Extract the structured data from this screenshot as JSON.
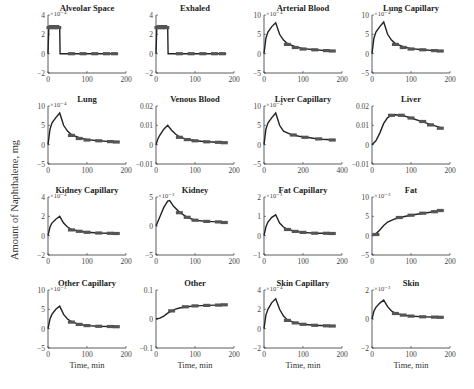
{
  "figure": {
    "ylabel": "Amount of Naphthalene, mg",
    "xlabel": "Time, min",
    "line_color": "#222222",
    "marker_color": "#555555"
  },
  "chart_data": [
    {
      "type": "line",
      "title": "Alveolar Space",
      "exponent": "×10⁻⁴",
      "ylim": [
        -2,
        4
      ],
      "yticks": [
        "4",
        "2",
        "0",
        "−2"
      ],
      "xlim": [
        0,
        200
      ],
      "xticks": [
        "0",
        "100",
        "200"
      ],
      "xlabel": "",
      "series": [
        {
          "name": "simulation",
          "x": [
            0,
            2,
            5,
            10,
            20,
            30,
            31,
            32,
            60,
            100,
            150,
            180
          ],
          "y": [
            0,
            2.7,
            2.7,
            2.7,
            2.7,
            2.7,
            0,
            0,
            0,
            0,
            0,
            0
          ]
        },
        {
          "name": "data",
          "x": [
            5,
            10,
            15,
            20,
            25,
            60,
            90,
            120,
            150,
            170
          ],
          "y": [
            2.7,
            2.8,
            2.7,
            2.8,
            2.7,
            0,
            0,
            0,
            0,
            0
          ]
        }
      ]
    },
    {
      "type": "line",
      "title": "Exhaled",
      "exponent": "",
      "ylim": [
        -2,
        4
      ],
      "yticks": [
        "4",
        "2",
        "0",
        "−2"
      ],
      "xlim": [
        0,
        200
      ],
      "xticks": [
        "0",
        "100",
        "200"
      ],
      "xlabel": "",
      "series": [
        {
          "name": "simulation",
          "x": [
            0,
            2,
            5,
            10,
            20,
            30,
            31,
            32,
            60,
            100,
            150,
            180
          ],
          "y": [
            0,
            2.7,
            2.7,
            2.7,
            2.7,
            2.7,
            0,
            0,
            0,
            0,
            0,
            0
          ]
        },
        {
          "name": "data",
          "x": [
            5,
            10,
            15,
            20,
            25,
            60,
            90,
            120,
            150,
            170
          ],
          "y": [
            2.7,
            2.8,
            2.7,
            2.8,
            2.7,
            0,
            0,
            0,
            0,
            0
          ]
        }
      ]
    },
    {
      "type": "line",
      "title": "Arterial Blood",
      "exponent": "×10⁻⁴",
      "ylim": [
        -5,
        10
      ],
      "yticks": [
        "10",
        "5",
        "0",
        "−5"
      ],
      "xlim": [
        0,
        200
      ],
      "xticks": [
        "0",
        "100",
        "200"
      ],
      "xlabel": "",
      "series": [
        {
          "name": "simulation",
          "x": [
            0,
            5,
            10,
            20,
            30,
            40,
            50,
            60,
            80,
            100,
            130,
            160,
            180
          ],
          "y": [
            0,
            4,
            5.6,
            7,
            8,
            5,
            3.5,
            2.6,
            1.8,
            1.3,
            1.0,
            0.8,
            0.7
          ]
        },
        {
          "name": "data",
          "x": [
            60,
            80,
            100,
            130,
            160,
            175
          ],
          "y": [
            2.4,
            1.6,
            1.2,
            1.0,
            0.8,
            0.7
          ]
        }
      ]
    },
    {
      "type": "line",
      "title": "Lung Capillary",
      "exponent": "×10⁻⁴",
      "ylim": [
        -5,
        10
      ],
      "yticks": [
        "10",
        "5",
        "0",
        "−5"
      ],
      "xlim": [
        0,
        200
      ],
      "xticks": [
        "0",
        "100",
        "200"
      ],
      "xlabel": "",
      "series": [
        {
          "name": "simulation",
          "x": [
            0,
            5,
            10,
            20,
            30,
            40,
            50,
            60,
            80,
            100,
            130,
            160,
            180
          ],
          "y": [
            0,
            4,
            5.6,
            7,
            8.2,
            5,
            3.5,
            2.6,
            1.8,
            1.3,
            1.0,
            0.8,
            0.7
          ]
        },
        {
          "name": "data",
          "x": [
            60,
            80,
            100,
            130,
            160,
            175
          ],
          "y": [
            2.4,
            1.6,
            1.2,
            1.0,
            0.8,
            0.7
          ]
        }
      ]
    },
    {
      "type": "line",
      "title": "Lung",
      "exponent": "×10⁻⁴",
      "ylim": [
        -5,
        10
      ],
      "yticks": [
        "10",
        "5",
        "0",
        "−5"
      ],
      "xlim": [
        0,
        200
      ],
      "xticks": [
        "0",
        "100",
        "200"
      ],
      "xlabel": "",
      "series": [
        {
          "name": "simulation",
          "x": [
            0,
            5,
            10,
            20,
            30,
            40,
            50,
            60,
            80,
            100,
            130,
            160,
            180
          ],
          "y": [
            0,
            4,
            5.6,
            7,
            8.2,
            5,
            3.5,
            2.6,
            1.8,
            1.3,
            1.0,
            0.8,
            0.7
          ]
        },
        {
          "name": "data",
          "x": [
            60,
            80,
            100,
            130,
            160,
            175
          ],
          "y": [
            2.4,
            1.6,
            1.2,
            1.0,
            0.8,
            0.7
          ]
        }
      ]
    },
    {
      "type": "line",
      "title": "Venous Blood",
      "exponent": "",
      "ylim": [
        -0.01,
        0.02
      ],
      "yticks": [
        "0.02",
        "0.01",
        "0",
        "−0.01"
      ],
      "xlim": [
        0,
        200
      ],
      "xticks": [
        "0",
        "100",
        "200"
      ],
      "xlabel": "",
      "series": [
        {
          "name": "simulation",
          "x": [
            0,
            5,
            10,
            20,
            30,
            40,
            50,
            60,
            80,
            100,
            130,
            160,
            180
          ],
          "y": [
            0,
            0.003,
            0.005,
            0.008,
            0.01,
            0.0075,
            0.0055,
            0.004,
            0.0028,
            0.002,
            0.0015,
            0.0012,
            0.001
          ]
        },
        {
          "name": "data",
          "x": [
            60,
            80,
            100,
            130,
            160,
            175
          ],
          "y": [
            0.0038,
            0.0026,
            0.002,
            0.0015,
            0.0012,
            0.001
          ]
        }
      ]
    },
    {
      "type": "line",
      "title": "Liver Capillary",
      "exponent": "×10⁻⁴",
      "ylim": [
        -5,
        10
      ],
      "yticks": [
        "10",
        "5",
        "0",
        "−5"
      ],
      "xlim": [
        0,
        400
      ],
      "xticks": [
        "0",
        "200",
        "400"
      ],
      "xlabel": "",
      "series": [
        {
          "name": "simulation",
          "x": [
            0,
            10,
            20,
            40,
            60,
            80,
            100,
            140,
            180,
            220,
            260,
            300,
            360
          ],
          "y": [
            0,
            4,
            5.6,
            7,
            8.2,
            5,
            3.5,
            2.6,
            2.2,
            1.9,
            1.6,
            1.4,
            1.2
          ]
        },
        {
          "name": "data",
          "x": [
            150,
            210,
            280,
            350
          ],
          "y": [
            2.5,
            1.9,
            1.5,
            1.2
          ]
        }
      ]
    },
    {
      "type": "line",
      "title": "Liver",
      "exponent": "",
      "ylim": [
        -0.01,
        0.02
      ],
      "yticks": [
        "0.02",
        "0.01",
        "0",
        "−0.01"
      ],
      "xlim": [
        0,
        200
      ],
      "xticks": [
        "0",
        "100",
        "200"
      ],
      "xlabel": "",
      "series": [
        {
          "name": "simulation",
          "x": [
            0,
            10,
            20,
            30,
            40,
            50,
            60,
            80,
            100,
            130,
            160,
            180
          ],
          "y": [
            0,
            0.002,
            0.006,
            0.011,
            0.014,
            0.0152,
            0.0155,
            0.015,
            0.0138,
            0.0118,
            0.0098,
            0.0085
          ]
        },
        {
          "name": "data",
          "x": [
            50,
            75,
            100,
            130,
            150,
            175
          ],
          "y": [
            0.0152,
            0.0152,
            0.0138,
            0.012,
            0.0102,
            0.0085
          ]
        }
      ]
    },
    {
      "type": "line",
      "title": "Kidney Capillary",
      "exponent": "×10⁻⁴",
      "ylim": [
        -2,
        4
      ],
      "yticks": [
        "4",
        "2",
        "0",
        "−2"
      ],
      "xlim": [
        0,
        200
      ],
      "xticks": [
        "0",
        "100",
        "200"
      ],
      "xlabel": "",
      "series": [
        {
          "name": "simulation",
          "x": [
            0,
            5,
            10,
            20,
            30,
            40,
            50,
            60,
            80,
            100,
            130,
            160,
            180
          ],
          "y": [
            0,
            0.9,
            1.3,
            1.7,
            2.0,
            1.3,
            0.9,
            0.65,
            0.45,
            0.35,
            0.28,
            0.24,
            0.22
          ]
        },
        {
          "name": "data",
          "x": [
            60,
            80,
            100,
            130,
            160,
            175
          ],
          "y": [
            0.6,
            0.45,
            0.35,
            0.28,
            0.24,
            0.22
          ]
        }
      ]
    },
    {
      "type": "line",
      "title": "Kidney",
      "exponent": "×10⁻³",
      "ylim": [
        -5,
        5
      ],
      "yticks": [
        "5",
        "0",
        "−5"
      ],
      "xlim": [
        0,
        200
      ],
      "xticks": [
        "0",
        "100",
        "200"
      ],
      "xlabel": "",
      "series": [
        {
          "name": "simulation",
          "x": [
            0,
            10,
            20,
            30,
            35,
            45,
            60,
            80,
            100,
            130,
            160,
            180
          ],
          "y": [
            0,
            1.6,
            3.2,
            4.3,
            4.4,
            3.4,
            2.4,
            1.5,
            1.0,
            0.8,
            0.7,
            0.6
          ]
        },
        {
          "name": "data",
          "x": [
            60,
            80,
            100,
            130,
            160,
            175
          ],
          "y": [
            2.3,
            1.5,
            1.0,
            0.8,
            0.7,
            0.6
          ]
        }
      ]
    },
    {
      "type": "line",
      "title": "Fat Capillary",
      "exponent": "×10⁻³",
      "ylim": [
        -1,
        2
      ],
      "yticks": [
        "2",
        "1",
        "0",
        "−1"
      ],
      "xlim": [
        0,
        200
      ],
      "xticks": [
        "0",
        "100",
        "200"
      ],
      "xlabel": "",
      "series": [
        {
          "name": "simulation",
          "x": [
            0,
            5,
            10,
            20,
            30,
            40,
            50,
            60,
            80,
            100,
            130,
            160,
            180
          ],
          "y": [
            0,
            0.45,
            0.7,
            0.95,
            1.08,
            0.65,
            0.45,
            0.33,
            0.22,
            0.17,
            0.13,
            0.12,
            0.11
          ]
        },
        {
          "name": "data",
          "x": [
            60,
            80,
            100,
            130,
            160,
            175
          ],
          "y": [
            0.32,
            0.22,
            0.17,
            0.13,
            0.12,
            0.11
          ]
        }
      ]
    },
    {
      "type": "line",
      "title": "Fat",
      "exponent": "×10⁻³",
      "ylim": [
        -5,
        10
      ],
      "yticks": [
        "10",
        "5",
        "0",
        "−5"
      ],
      "xlim": [
        0,
        200
      ],
      "xticks": [
        "0",
        "100",
        "200"
      ],
      "xlabel": "",
      "series": [
        {
          "name": "simulation",
          "x": [
            0,
            10,
            20,
            30,
            40,
            60,
            80,
            100,
            130,
            160,
            180
          ],
          "y": [
            0,
            0.5,
            1.5,
            2.6,
            3.5,
            4.4,
            4.9,
            5.3,
            5.8,
            6.2,
            6.5
          ]
        },
        {
          "name": "data",
          "x": [
            10,
            70,
            100,
            130,
            160,
            175
          ],
          "y": [
            0.3,
            4.7,
            5.3,
            5.8,
            6.2,
            6.5
          ]
        }
      ]
    },
    {
      "type": "line",
      "title": "Other Capillary",
      "exponent": "×10⁻³",
      "ylim": [
        -5,
        10
      ],
      "yticks": [
        "10",
        "5",
        "0",
        "−5"
      ],
      "xlim": [
        0,
        200
      ],
      "xticks": [
        "0",
        "100",
        "200"
      ],
      "xlabel": "Time, min",
      "series": [
        {
          "name": "simulation",
          "x": [
            0,
            5,
            10,
            20,
            30,
            40,
            50,
            60,
            80,
            100,
            130,
            160,
            180
          ],
          "y": [
            0,
            2.5,
            3.7,
            5.0,
            5.8,
            3.7,
            2.5,
            1.8,
            1.1,
            0.8,
            0.6,
            0.55,
            0.5
          ]
        },
        {
          "name": "data",
          "x": [
            60,
            80,
            100,
            130,
            160,
            175
          ],
          "y": [
            1.7,
            1.1,
            0.8,
            0.6,
            0.55,
            0.5
          ]
        }
      ]
    },
    {
      "type": "line",
      "title": "Other",
      "exponent": "",
      "ylim": [
        -0.1,
        0.1
      ],
      "yticks": [
        "0.1",
        "0",
        "−0.1"
      ],
      "xlim": [
        0,
        200
      ],
      "xticks": [
        "0",
        "100",
        "200"
      ],
      "xlabel": "Time, min",
      "series": [
        {
          "name": "simulation",
          "x": [
            0,
            10,
            20,
            30,
            40,
            50,
            60,
            80,
            100,
            130,
            160,
            180
          ],
          "y": [
            0,
            0.003,
            0.01,
            0.02,
            0.028,
            0.034,
            0.038,
            0.042,
            0.045,
            0.047,
            0.048,
            0.049
          ]
        },
        {
          "name": "data",
          "x": [
            40,
            75,
            100,
            130,
            160,
            175
          ],
          "y": [
            0.028,
            0.042,
            0.045,
            0.047,
            0.048,
            0.049
          ]
        }
      ]
    },
    {
      "type": "line",
      "title": "Skin Capillary",
      "exponent": "×10⁻⁴",
      "ylim": [
        -2,
        4
      ],
      "yticks": [
        "4",
        "2",
        "0",
        "−2"
      ],
      "xlim": [
        0,
        200
      ],
      "xticks": [
        "0",
        "100",
        "200"
      ],
      "xlabel": "Time, min",
      "series": [
        {
          "name": "simulation",
          "x": [
            0,
            5,
            10,
            20,
            30,
            40,
            50,
            60,
            80,
            100,
            130,
            160,
            180
          ],
          "y": [
            0,
            1.4,
            2.0,
            2.7,
            3.1,
            2.0,
            1.3,
            0.9,
            0.6,
            0.45,
            0.35,
            0.3,
            0.28
          ]
        },
        {
          "name": "data",
          "x": [
            60,
            80,
            100,
            130,
            160,
            175
          ],
          "y": [
            0.85,
            0.6,
            0.45,
            0.35,
            0.3,
            0.28
          ]
        }
      ]
    },
    {
      "type": "line",
      "title": "Skin",
      "exponent": "×10⁻³",
      "ylim": [
        -2,
        2
      ],
      "yticks": [
        "2",
        "0",
        "−2"
      ],
      "xlim": [
        0,
        200
      ],
      "xticks": [
        "0",
        "100",
        "200"
      ],
      "xlabel": "Time, min",
      "series": [
        {
          "name": "simulation",
          "x": [
            0,
            5,
            10,
            20,
            30,
            40,
            50,
            60,
            80,
            100,
            130,
            160,
            180
          ],
          "y": [
            0,
            0.55,
            0.8,
            1.1,
            1.3,
            0.85,
            0.55,
            0.4,
            0.27,
            0.2,
            0.15,
            0.13,
            0.12
          ]
        },
        {
          "name": "data",
          "x": [
            60,
            80,
            100,
            130,
            160,
            175
          ],
          "y": [
            0.38,
            0.27,
            0.2,
            0.15,
            0.13,
            0.12
          ]
        }
      ]
    }
  ]
}
